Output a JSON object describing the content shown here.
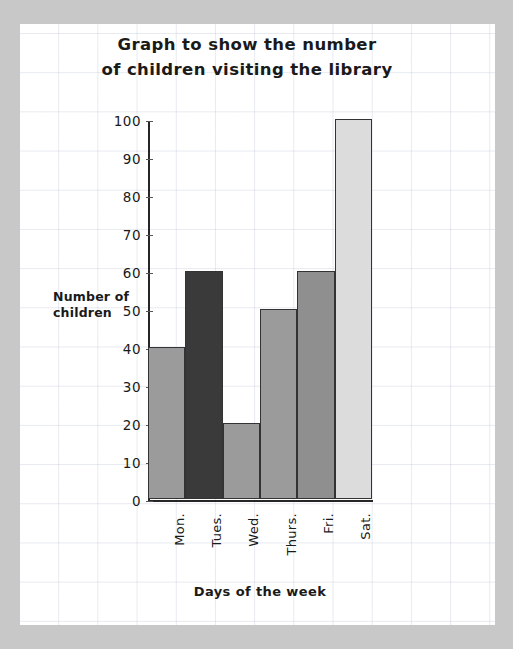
{
  "chart_data": {
    "type": "bar",
    "title": "Graph to show the number\nof children visiting the library",
    "xlabel": "Days of the week",
    "ylabel": "Number of\nchildren",
    "categories": [
      "Mon.",
      "Tues.",
      "Wed.",
      "Thurs.",
      "Fri.",
      "Sat."
    ],
    "values": [
      40,
      60,
      20,
      50,
      60,
      100
    ],
    "bar_colors": [
      "#9b9b9b",
      "#3a3a3a",
      "#9b9b9b",
      "#9b9b9b",
      "#8f8f8f",
      "#dcdcdc"
    ],
    "bar_outline_color": "#333333",
    "ylim": [
      0,
      100
    ],
    "yticks": [
      0,
      10,
      20,
      30,
      40,
      50,
      60,
      70,
      80,
      90,
      100
    ],
    "ytick_labels": [
      "0",
      "10",
      "20",
      "30",
      "40",
      "50",
      "60",
      "70",
      "80",
      "90",
      "100"
    ],
    "grid": true,
    "grid_color": "#afb9cd",
    "legend": null,
    "axis_color": "#262626",
    "page_background": "#ffffff",
    "canvas_background": "#c8c8c8"
  }
}
